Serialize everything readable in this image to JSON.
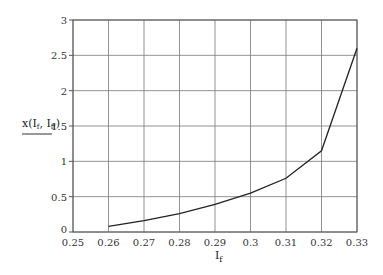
{
  "chart_data": {
    "type": "line",
    "title": "",
    "xlabel": "I_f",
    "xlabel_main": "I",
    "xlabel_sub": "f",
    "ylabel": "x(I_f, I_ff)",
    "ylabel_parts": {
      "a": "x(I",
      "b": "f",
      "c": ", I",
      "d": "ff",
      "e": ")"
    },
    "xlim": [
      0.25,
      0.33
    ],
    "ylim": [
      0,
      3
    ],
    "grid": true,
    "x_ticks": [
      "0.25",
      "0.26",
      "0.27",
      "0.28",
      "0.29",
      "0.3",
      "0.31",
      "0.32",
      "0.33"
    ],
    "y_ticks": [
      "0",
      "0.5",
      "1",
      "1.5",
      "2",
      "2.5",
      "3"
    ],
    "x": [
      0.26,
      0.27,
      0.28,
      0.29,
      0.3,
      0.31,
      0.32,
      0.33
    ],
    "series": [
      {
        "name": "x(I_f, I_ff)",
        "values": [
          0.08,
          0.16,
          0.26,
          0.39,
          0.55,
          0.76,
          1.15,
          2.6
        ]
      }
    ]
  }
}
